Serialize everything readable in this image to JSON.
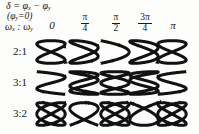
{
  "figure": {
    "type": "lissajous-table",
    "background_color": "#fdfdfc",
    "stroke_color": "#111111"
  },
  "legend": {
    "line1_delta": "δ",
    "line1_eq": " = ",
    "line1_phix": "φ",
    "line1_subx": "x",
    "line1_minus": " − ",
    "line1_phiy": "φ",
    "line1_suby": "y",
    "line2_open": "(",
    "line2_phi": "φ",
    "line2_sub": "y",
    "line2_eq": "=0)",
    "line3_omega1": "ω",
    "line3_sub1": "x",
    "line3_colon": " : ",
    "line3_omega2": "ω",
    "line3_sub2": "y"
  },
  "columns": [
    {
      "label": "0",
      "kind": "plain",
      "numerator": "",
      "denominator": "",
      "delta_radians": 0.0
    },
    {
      "label": "π/4",
      "kind": "fraction",
      "numerator": "π",
      "denominator": "4",
      "delta_radians": 0.7854
    },
    {
      "label": "π/2",
      "kind": "fraction",
      "numerator": "π",
      "denominator": "2",
      "delta_radians": 1.5708
    },
    {
      "label": "3π/4",
      "kind": "fraction",
      "numerator": "3π",
      "denominator": "4",
      "delta_radians": 2.3562
    },
    {
      "label": "π",
      "kind": "plain",
      "numerator": "",
      "denominator": "",
      "delta_radians": 3.1416
    }
  ],
  "rows": [
    {
      "label": "2:1",
      "ratio_x": 2,
      "ratio_y": 1
    },
    {
      "label": "3:1",
      "ratio_x": 3,
      "ratio_y": 1
    },
    {
      "label": "3:2",
      "ratio_x": 3,
      "ratio_y": 2
    }
  ],
  "chart_data": {
    "type": "line",
    "title": "",
    "xlabel": "",
    "ylabel": "",
    "row_ratios": [
      "2:1",
      "3:1",
      "3:2"
    ],
    "column_phases": [
      "0",
      "π/4",
      "π/2",
      "3π/4",
      "π"
    ],
    "column_phase_values": [
      0.0,
      0.7854,
      1.5708,
      2.3562,
      3.1416
    ],
    "curves": [
      {
        "row": "2:1",
        "column": "0",
        "nx": 2,
        "ny": 1,
        "delta": 0.0
      },
      {
        "row": "2:1",
        "column": "π/4",
        "nx": 2,
        "ny": 1,
        "delta": 0.7854
      },
      {
        "row": "2:1",
        "column": "π/2",
        "nx": 2,
        "ny": 1,
        "delta": 1.5708
      },
      {
        "row": "2:1",
        "column": "3π/4",
        "nx": 2,
        "ny": 1,
        "delta": 2.3562
      },
      {
        "row": "2:1",
        "column": "π",
        "nx": 2,
        "ny": 1,
        "delta": 3.1416
      },
      {
        "row": "3:1",
        "column": "0",
        "nx": 3,
        "ny": 1,
        "delta": 0.0
      },
      {
        "row": "3:1",
        "column": "π/4",
        "nx": 3,
        "ny": 1,
        "delta": 0.7854
      },
      {
        "row": "3:1",
        "column": "π/2",
        "nx": 3,
        "ny": 1,
        "delta": 1.5708
      },
      {
        "row": "3:1",
        "column": "3π/4",
        "nx": 3,
        "ny": 1,
        "delta": 2.3562
      },
      {
        "row": "3:1",
        "column": "π",
        "nx": 3,
        "ny": 1,
        "delta": 3.1416
      },
      {
        "row": "3:2",
        "column": "0",
        "nx": 3,
        "ny": 2,
        "delta": 0.0
      },
      {
        "row": "3:2",
        "column": "π/4",
        "nx": 3,
        "ny": 2,
        "delta": 0.7854
      },
      {
        "row": "3:2",
        "column": "π/2",
        "nx": 3,
        "ny": 2,
        "delta": 1.5708
      },
      {
        "row": "3:2",
        "column": "3π/4",
        "nx": 3,
        "ny": 2,
        "delta": 2.3562
      },
      {
        "row": "3:2",
        "column": "π",
        "nx": 3,
        "ny": 2,
        "delta": 3.1416
      }
    ]
  }
}
